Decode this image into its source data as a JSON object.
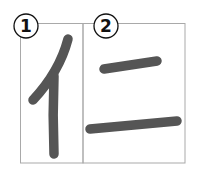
{
  "steps": [
    {
      "label": "1",
      "description": "Stroke 1: left radical 亻 (slanted stroke and vertical stroke)"
    },
    {
      "label": "2",
      "description": "Stroke 2: two horizontal strokes 二"
    }
  ],
  "colors": {
    "stroke": "#555555",
    "frame": "#a9a9a9",
    "number": "#111111"
  }
}
